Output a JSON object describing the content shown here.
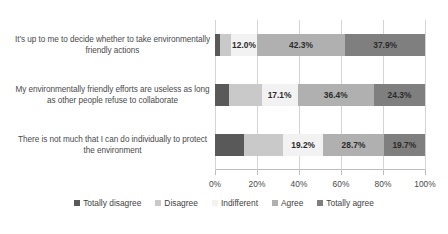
{
  "chart_data": {
    "type": "bar",
    "orientation": "horizontal",
    "stacked": true,
    "normalized": "percent",
    "title": "",
    "subtitle": "",
    "xlabel": "",
    "ylabel": "",
    "xlim": [
      0,
      100
    ],
    "grid": true,
    "legend_position": "bottom",
    "xticks": [
      0,
      20,
      40,
      60,
      80,
      100
    ],
    "xtick_labels": [
      "0%",
      "20%",
      "40%",
      "60%",
      "80%",
      "100%"
    ],
    "categories": [
      "It’s up to me to decide whether to take environmentally friendly actions",
      "My environmentally friendly efforts are useless as long as other people refuse to collaborate",
      "There is not much that I can do individually to protect the environment"
    ],
    "series": [
      {
        "name": "Totally disagree",
        "color": "#595959",
        "values": [
          2.5,
          6.5,
          14.0
        ]
      },
      {
        "name": "Disagree",
        "color": "#c9c9c9",
        "values": [
          5.3,
          15.7,
          18.4
        ]
      },
      {
        "name": "Indifferent",
        "color": "#f2f2f2",
        "values": [
          12.0,
          17.1,
          19.2
        ]
      },
      {
        "name": "Agree",
        "color": "#b0b0b0",
        "values": [
          42.3,
          36.4,
          28.7
        ]
      },
      {
        "name": "Totally agree",
        "color": "#7f7f7f",
        "values": [
          37.9,
          24.3,
          19.7
        ]
      }
    ],
    "data_labels": [
      [
        "",
        "",
        "12.0%",
        "42.3%",
        "37.9%"
      ],
      [
        "",
        "",
        "17.1%",
        "36.4%",
        "24.3%"
      ],
      [
        "",
        "",
        "19.2%",
        "28.7%",
        "19.7%"
      ]
    ]
  },
  "legend": {
    "items": [
      {
        "label": "Totally disagree",
        "color": "#595959"
      },
      {
        "label": "Disagree",
        "color": "#c9c9c9"
      },
      {
        "label": "Indifferent",
        "color": "#f2f2f2"
      },
      {
        "label": "Agree",
        "color": "#b0b0b0"
      },
      {
        "label": "Totally agree",
        "color": "#7f7f7f"
      }
    ]
  }
}
